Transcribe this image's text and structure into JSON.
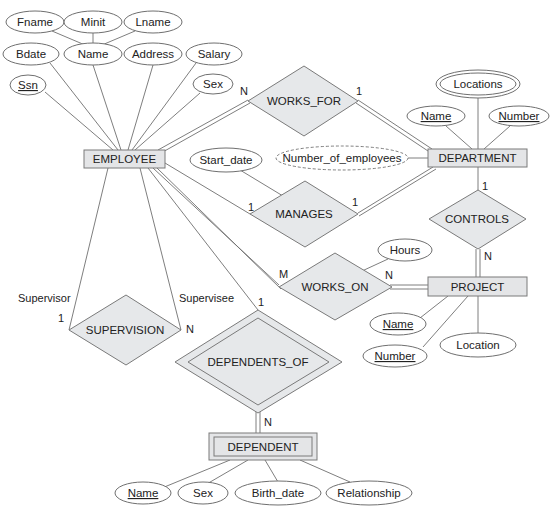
{
  "diagram": {
    "type": "ER diagram",
    "entities": [
      {
        "id": "employee",
        "label": "EMPLOYEE",
        "weak": false
      },
      {
        "id": "department",
        "label": "DEPARTMENT",
        "weak": false
      },
      {
        "id": "project",
        "label": "PROJECT",
        "weak": false
      },
      {
        "id": "dependent",
        "label": "DEPENDENT",
        "weak": true
      }
    ],
    "relationships": [
      {
        "id": "works_for",
        "label": "WORKS_FOR",
        "identifying": false
      },
      {
        "id": "manages",
        "label": "MANAGES",
        "identifying": false
      },
      {
        "id": "works_on",
        "label": "WORKS_ON",
        "identifying": false
      },
      {
        "id": "controls",
        "label": "CONTROLS",
        "identifying": false
      },
      {
        "id": "supervision",
        "label": "SUPERVISION",
        "identifying": false
      },
      {
        "id": "dependents_of",
        "label": "DEPENDENTS_OF",
        "identifying": true
      }
    ],
    "attributes": {
      "employee": {
        "fname": "Fname",
        "minit": "Minit",
        "lname": "Lname",
        "bdate": "Bdate",
        "name": "Name",
        "address": "Address",
        "salary": "Salary",
        "ssn": "Ssn",
        "sex": "Sex"
      },
      "department": {
        "locations": "Locations",
        "name": "Name",
        "number": "Number",
        "number_of_employees": "Number_of_employees"
      },
      "project": {
        "name": "Name",
        "number": "Number",
        "location": "Location"
      },
      "works_on": {
        "hours": "Hours"
      },
      "manages": {
        "start_date": "Start_date"
      },
      "dependent": {
        "name": "Name",
        "sex": "Sex",
        "birth_date": "Birth_date",
        "relationship": "Relationship"
      }
    },
    "cardinalities": {
      "works_for_employee": "N",
      "works_for_department": "1",
      "manages_employee": "1",
      "manages_department": "1",
      "works_on_employee": "M",
      "works_on_project": "N",
      "controls_department": "1",
      "controls_project": "N",
      "supervision_supervisor": "1",
      "supervision_supervisee": "N",
      "dependents_of_employee": "1",
      "dependents_of_dependent": "N"
    },
    "roles": {
      "supervisor": "Supervisor",
      "supervisee": "Supervisee"
    }
  }
}
